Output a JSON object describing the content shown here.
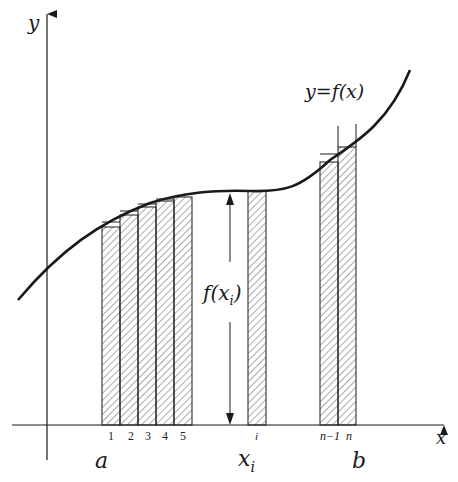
{
  "diagram": {
    "type": "riemann-sum",
    "colors": {
      "ink": "#1a1a1a",
      "background": "#ffffff",
      "hatch": "#333333"
    },
    "axes": {
      "x_label": "x",
      "y_label": "y"
    },
    "curve": {
      "label": "y=f(x)"
    },
    "interval": {
      "a_label": "a",
      "b_label": "b"
    },
    "subinterval_labels": [
      "1",
      "2",
      "3",
      "4",
      "5",
      "i",
      "n−1",
      "n"
    ],
    "sample_point_label": "x",
    "sample_point_subscript": "i",
    "height_label_prefix": "f(x",
    "height_label_subscript": "i",
    "height_label_suffix": ")"
  }
}
